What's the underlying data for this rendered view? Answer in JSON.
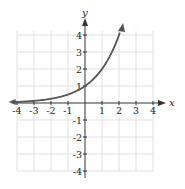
{
  "chart_data": {
    "type": "line",
    "title": "",
    "xlabel": "x",
    "ylabel": "y",
    "xlim": [
      -4,
      4
    ],
    "ylim": [
      -4,
      4
    ],
    "grid": true,
    "x_ticks": [
      "-4",
      "-3",
      "-2",
      "-1",
      "1",
      "2",
      "3",
      "4"
    ],
    "y_ticks": [
      "4",
      "3",
      "2",
      "1",
      "-1",
      "-2",
      "-3",
      "-4"
    ],
    "series": [
      {
        "name": "y = 2^x",
        "x": [
          -4,
          -3,
          -2,
          -1,
          0,
          1,
          2
        ],
        "values": [
          0.0625,
          0.125,
          0.25,
          0.5,
          1,
          2,
          4
        ],
        "left_arrow": true,
        "right_arrow": true
      }
    ],
    "colors": {
      "curve": "#555555",
      "grid": "#d9d9d9",
      "axis": "#333333"
    }
  }
}
